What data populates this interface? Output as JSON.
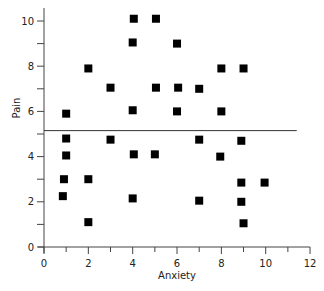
{
  "chart_data": {
    "type": "scatter",
    "title": "",
    "xlabel": "Anxiety",
    "ylabel": "Pain",
    "xlim": [
      0,
      12
    ],
    "ylim": [
      0,
      10.5
    ],
    "x_ticks": [
      0,
      2,
      4,
      6,
      8,
      10,
      12
    ],
    "x_minor_ticks": [
      1,
      3,
      5,
      7,
      9,
      11
    ],
    "y_ticks": [
      0,
      2,
      4,
      6,
      8,
      10
    ],
    "y_minor_ticks": [
      1,
      3,
      5,
      7,
      9
    ],
    "grid": false,
    "legend": null,
    "marker": "square",
    "marker_color": "#000000",
    "reference_line": {
      "orientation": "horizontal",
      "y": 5.15,
      "x_range": [
        0,
        11.4
      ],
      "color": "#333333"
    },
    "points": [
      {
        "x": 1.0,
        "y": 5.9
      },
      {
        "x": 1.0,
        "y": 4.8
      },
      {
        "x": 1.0,
        "y": 4.05
      },
      {
        "x": 0.9,
        "y": 3.0
      },
      {
        "x": 0.85,
        "y": 2.25
      },
      {
        "x": 2.0,
        "y": 7.9
      },
      {
        "x": 2.0,
        "y": 3.0
      },
      {
        "x": 2.0,
        "y": 1.1
      },
      {
        "x": 3.0,
        "y": 7.05
      },
      {
        "x": 3.0,
        "y": 4.75
      },
      {
        "x": 4.05,
        "y": 10.1
      },
      {
        "x": 4.0,
        "y": 9.05
      },
      {
        "x": 4.0,
        "y": 6.05
      },
      {
        "x": 4.05,
        "y": 4.1
      },
      {
        "x": 4.0,
        "y": 2.15
      },
      {
        "x": 5.05,
        "y": 10.1
      },
      {
        "x": 5.05,
        "y": 7.05
      },
      {
        "x": 5.0,
        "y": 4.1
      },
      {
        "x": 6.0,
        "y": 9.0
      },
      {
        "x": 6.05,
        "y": 7.05
      },
      {
        "x": 6.0,
        "y": 6.0
      },
      {
        "x": 7.0,
        "y": 7.0
      },
      {
        "x": 7.0,
        "y": 4.75
      },
      {
        "x": 7.0,
        "y": 2.05
      },
      {
        "x": 8.0,
        "y": 7.9
      },
      {
        "x": 8.0,
        "y": 6.0
      },
      {
        "x": 7.95,
        "y": 4.0
      },
      {
        "x": 9.0,
        "y": 7.9
      },
      {
        "x": 8.9,
        "y": 4.7
      },
      {
        "x": 8.9,
        "y": 2.85
      },
      {
        "x": 8.9,
        "y": 2.0
      },
      {
        "x": 9.0,
        "y": 1.05
      },
      {
        "x": 9.95,
        "y": 2.85
      }
    ]
  },
  "labels": {
    "xlabel": "Anxiety",
    "ylabel": "Pain"
  }
}
